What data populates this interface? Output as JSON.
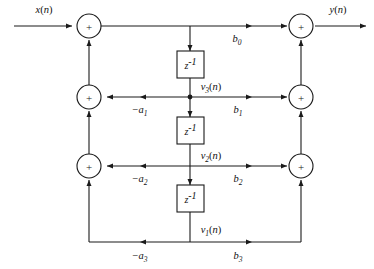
{
  "figure": {
    "type": "signal-flow-graph",
    "background_color": "#ffffff",
    "line_color": "#1a1a1a"
  },
  "signals": {
    "input_label": "x(n)",
    "output_label": "y(n)",
    "state_labels": [
      "v1(n)",
      "v2(n)",
      "v3(n)"
    ]
  },
  "delays": [
    {
      "id": "delay-1",
      "label_base": "z",
      "label_exponent": "-1"
    },
    {
      "id": "delay-2",
      "label_base": "z",
      "label_exponent": "-1"
    },
    {
      "id": "delay-3",
      "label_base": "z",
      "label_exponent": "-1"
    }
  ],
  "feedback_coefficients": [
    {
      "id": "a1",
      "base": "-a",
      "subscript": "1"
    },
    {
      "id": "a2",
      "base": "-a",
      "subscript": "2"
    },
    {
      "id": "a3",
      "base": "-a",
      "subscript": "3"
    }
  ],
  "feedforward_coefficients": [
    {
      "id": "b0",
      "base": "b",
      "subscript": "0"
    },
    {
      "id": "b1",
      "base": "b",
      "subscript": "1"
    },
    {
      "id": "b2",
      "base": "b",
      "subscript": "2"
    },
    {
      "id": "b3",
      "base": "b",
      "subscript": "3"
    }
  ],
  "adders": {
    "symbol": "+",
    "left_column_count": 3,
    "right_column_count": 3
  },
  "state_vars": {
    "v3": {
      "base": "v",
      "subscript": "3",
      "arg": "(n)"
    },
    "v2": {
      "base": "v",
      "subscript": "2",
      "arg": "(n)"
    },
    "v1": {
      "base": "v",
      "subscript": "1",
      "arg": "(n)"
    }
  },
  "io": {
    "x": {
      "base": "x",
      "arg": "(n)"
    },
    "y": {
      "base": "y",
      "arg": "(n)"
    }
  }
}
